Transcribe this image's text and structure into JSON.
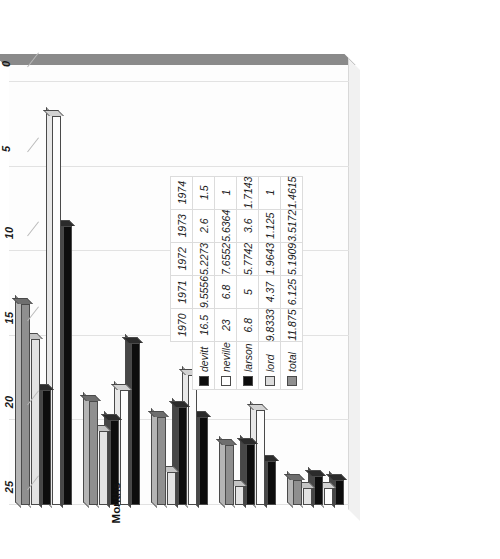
{
  "chart_data": {
    "type": "bar",
    "orientation": "horizontal-3d",
    "title": "",
    "xlabel": "",
    "ylabel": "Months",
    "categories": [
      "1970",
      "1971",
      "1972",
      "1973",
      "1974"
    ],
    "series": [
      {
        "name": "devitt",
        "swatch": "#0d0d0d",
        "values": [
          16.5,
          9.5556,
          5.2273,
          2.6,
          1.5
        ]
      },
      {
        "name": "neville",
        "swatch": "#ffffff",
        "values": [
          23,
          6.8,
          7.6552,
          5.6364,
          1
        ]
      },
      {
        "name": "larson",
        "swatch": "#0d0d0d",
        "values": [
          6.8,
          5,
          5.7742,
          3.6,
          1.7143
        ]
      },
      {
        "name": "lord",
        "swatch": "#dcdcdc",
        "values": [
          9.8333,
          4.37,
          1.9643,
          1.125,
          1
        ]
      },
      {
        "name": "total",
        "swatch": "#8f8f8f",
        "values": [
          11.875,
          6.125,
          5.1909,
          3.5172,
          1.4615
        ]
      }
    ],
    "value_axis": {
      "label": "Months",
      "ticks": [
        "25",
        "20",
        "15",
        "10",
        "5",
        "0"
      ],
      "tick_values": [
        25,
        20,
        15,
        10,
        5,
        0
      ],
      "min": 0,
      "max": 26,
      "grid": true
    },
    "legend": {
      "position": "data-table",
      "entries": [
        "devitt",
        "neville",
        "larson",
        "lord",
        "total"
      ]
    },
    "data_table": {
      "column_headers": [
        "1970",
        "1971",
        "1972",
        "1973",
        "1974"
      ],
      "rows": [
        {
          "label": "devitt",
          "cells": [
            "16.5",
            "9.5556",
            "5.2273",
            "2.6",
            "1.5"
          ]
        },
        {
          "label": "neville",
          "cells": [
            "23",
            "6.8",
            "7.6552",
            "5.6364",
            "1"
          ]
        },
        {
          "label": "larson",
          "cells": [
            "6.8",
            "5",
            "5.7742",
            "3.6",
            "1.7143"
          ]
        },
        {
          "label": "lord",
          "cells": [
            "9.8333",
            "4.37",
            "1.9643",
            "1.125",
            "1"
          ]
        },
        {
          "label": "total",
          "cells": [
            "11.875",
            "6.125",
            "5.1909",
            "3.5172",
            "1.4615"
          ]
        }
      ]
    }
  },
  "axis_ticks": {
    "t0": "25",
    "t1": "20",
    "t2": "15",
    "t3": "10",
    "t4": "5",
    "t5": "0"
  },
  "axis": {
    "months_label": "Months"
  },
  "years": {
    "y0": "1970",
    "y1": "1971",
    "y2": "1972",
    "y3": "1973",
    "y4": "1974"
  },
  "legend_labels": {
    "devitt": "devitt",
    "neville": "neville",
    "larson": "larson",
    "lord": "lord",
    "total": "total"
  }
}
